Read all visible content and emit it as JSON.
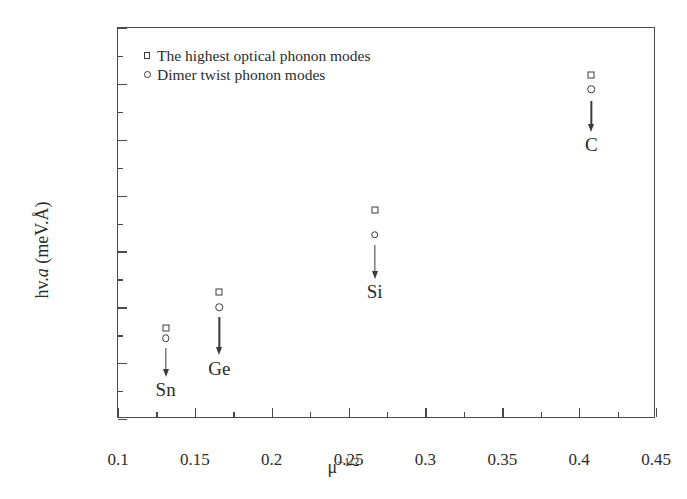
{
  "chart_data": {
    "type": "scatter",
    "title": "",
    "xlabel": "μ−1/2",
    "ylabel": "hv.a (meV.Å)",
    "xlim": [
      0.1,
      0.45
    ],
    "ylim": [
      0,
      700
    ],
    "grid": false,
    "legend_position": "top-left",
    "x_ticks": [
      "0.1",
      "0.15",
      "0.2",
      "0.25",
      "0.3",
      "0.35",
      "0.4",
      "0.45"
    ],
    "x_tick_values": [
      0.1,
      0.15,
      0.2,
      0.25,
      0.3,
      0.35,
      0.4,
      0.45
    ],
    "x_minor_step": 0.025,
    "y_ticks": [
      "0",
      "100",
      "200",
      "300",
      "400",
      "500",
      "600",
      "700"
    ],
    "y_tick_values": [
      0,
      100,
      200,
      300,
      400,
      500,
      600,
      700
    ],
    "y_minor_step": 50,
    "categories": [
      "Sn",
      "Ge",
      "Si",
      "C"
    ],
    "x": [
      0.131,
      0.166,
      0.267,
      0.408
    ],
    "series": [
      {
        "name": "The highest optical phonon modes",
        "marker": "open-square",
        "values": [
          163,
          228,
          375,
          615
        ]
      },
      {
        "name": "Dimer twist phonon modes",
        "marker": "open-circle",
        "values": [
          145,
          200,
          330,
          590
        ]
      }
    ],
    "annotations": [
      {
        "label": "Sn",
        "x": 0.131,
        "y": 70,
        "arrow_from_y": 128,
        "arrow_to_y": 78
      },
      {
        "label": "Ge",
        "x": 0.166,
        "y": 108,
        "arrow_from_y": 182,
        "arrow_to_y": 118
      },
      {
        "label": "Si",
        "x": 0.267,
        "y": 245,
        "arrow_from_y": 312,
        "arrow_to_y": 255
      },
      {
        "label": "C",
        "x": 0.408,
        "y": 508,
        "arrow_from_y": 570,
        "arrow_to_y": 518
      }
    ]
  },
  "legend": {
    "items": [
      {
        "marker": "open-square",
        "label": "The highest optical phonon modes"
      },
      {
        "marker": "open-circle",
        "label": "Dimer twist phonon modes"
      }
    ]
  },
  "axis_titles": {
    "y_prefix": "hv.",
    "y_italic": "a",
    "y_suffix": " (meV.Å)",
    "x_base": "μ",
    "x_exponent": "−1/2"
  }
}
